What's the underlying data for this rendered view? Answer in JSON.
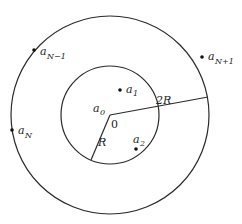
{
  "diagram": {
    "center": {
      "x": 110,
      "y": 115
    },
    "inner_circle": {
      "radius": 49,
      "label": "R"
    },
    "outer_circle": {
      "radius": 99,
      "label": "2R"
    },
    "origin_label": "0",
    "stroke_color": "#2a2a2a",
    "points": [
      {
        "name": "a",
        "sub": "0",
        "x": 110,
        "y": 115,
        "label_x": 94,
        "label_y": 112,
        "sub_x": 101,
        "sub_y": 115,
        "dot": false
      },
      {
        "name": "a",
        "sub": "1",
        "x": 120,
        "y": 90,
        "label_x": 126,
        "label_y": 93,
        "sub_x": 133,
        "sub_y": 96,
        "dot": true
      },
      {
        "name": "a",
        "sub": "2",
        "x": 136,
        "y": 149,
        "label_x": 133,
        "label_y": 142,
        "sub_x": 140,
        "sub_y": 145,
        "dot": true
      },
      {
        "name": "a",
        "sub": "N−1",
        "x": 34,
        "y": 50,
        "label_x": 40,
        "label_y": 54,
        "sub_x": 47,
        "sub_y": 58,
        "dot": true
      },
      {
        "name": "a",
        "sub": "N",
        "x": 12,
        "y": 130,
        "label_x": 18,
        "label_y": 134,
        "sub_x": 25,
        "sub_y": 138,
        "dot": true
      },
      {
        "name": "a",
        "sub": "N+1",
        "x": 202,
        "y": 57,
        "label_x": 208,
        "label_y": 60,
        "sub_x": 215,
        "sub_y": 64,
        "dot": true
      }
    ],
    "labels": {
      "zero": "0",
      "R": "R",
      "twoR": "2R"
    }
  }
}
